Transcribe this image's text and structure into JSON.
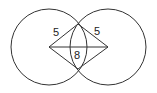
{
  "diagram": {
    "type": "two-intersecting-circles",
    "colors": {
      "stroke": "#333333",
      "background": "#ffffff",
      "text": "#222222"
    },
    "circles": [
      {
        "name": "left-circle",
        "cx": 49,
        "cy": 47,
        "r": 38
      },
      {
        "name": "right-circle",
        "cx": 108,
        "cy": 47,
        "r": 38
      }
    ],
    "points": {
      "left_center": {
        "x": 49,
        "y": 47
      },
      "right_center": {
        "x": 108,
        "y": 47
      },
      "top_intersection": {
        "x": 78,
        "y": 24
      },
      "bottom_intersection": {
        "x": 78,
        "y": 69
      }
    },
    "labels": {
      "left_radius": "5",
      "right_radius": "5",
      "center_distance": "8"
    }
  }
}
